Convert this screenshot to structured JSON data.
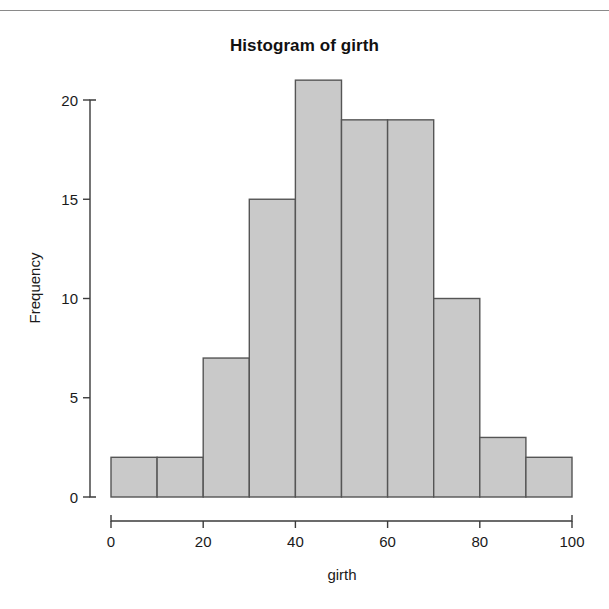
{
  "page": {
    "background_color": "#ffffff",
    "rule_color": "#8a8a8a"
  },
  "chart_data": {
    "type": "bar",
    "title": "Histogram of girth",
    "xlabel": "girth",
    "ylabel": "Frequency",
    "categories": [
      "0-10",
      "10-20",
      "20-30",
      "30-40",
      "40-50",
      "50-60",
      "60-70",
      "70-80",
      "80-90",
      "90-100"
    ],
    "bin_edges": [
      0,
      10,
      20,
      30,
      40,
      50,
      60,
      70,
      80,
      90,
      100
    ],
    "values": [
      2,
      2,
      7,
      15,
      21,
      19,
      19,
      10,
      3,
      2
    ],
    "xlim": [
      0,
      100
    ],
    "ylim": [
      0,
      21
    ],
    "xticks": [
      0,
      20,
      40,
      60,
      80,
      100
    ],
    "yticks": [
      0,
      5,
      10,
      15,
      20
    ],
    "xtick_labels": [
      "0",
      "20",
      "40",
      "60",
      "80",
      "100"
    ],
    "ytick_labels": [
      "0",
      "5",
      "10",
      "15",
      "20"
    ],
    "grid": false,
    "legend": false,
    "bar_fill_color": "#c9c9c9",
    "bar_border_color": "#555555",
    "axis_color": "#3b3b3b"
  }
}
